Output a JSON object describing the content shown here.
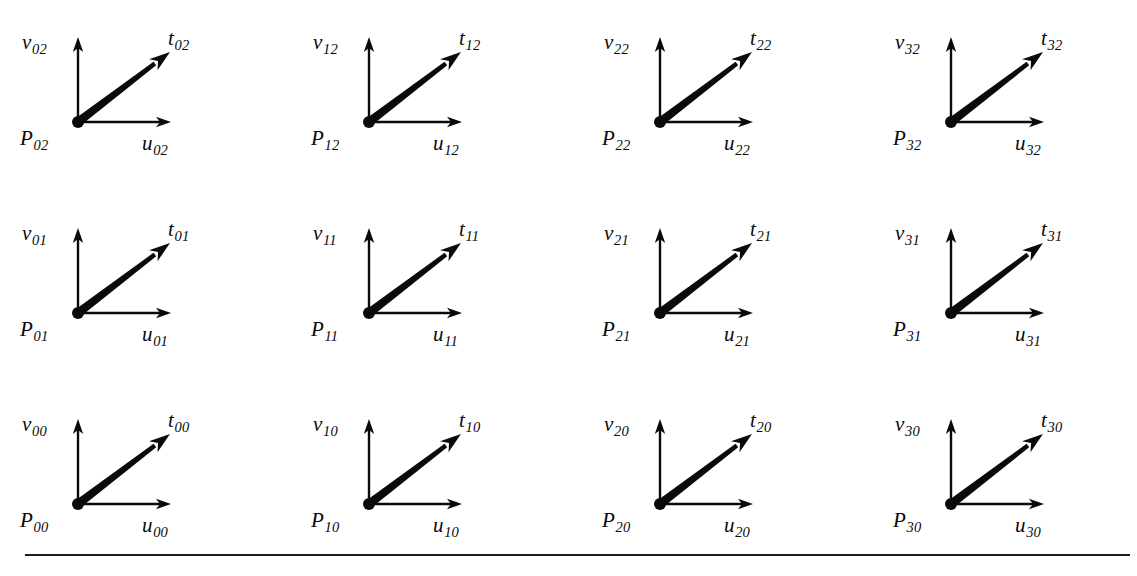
{
  "figure": {
    "background_color": "#ffffff",
    "ink_color": "#0a0a0a",
    "grid": {
      "columns": 4,
      "rows": 3
    },
    "cells": [
      {
        "id": "cell-0-2",
        "column": 0,
        "row": 2,
        "point_label": "P",
        "point_sub": "02",
        "v_label": "v",
        "v_sub": "02",
        "u_label": "u",
        "u_sub": "02",
        "t_label": "t",
        "t_sub": "02"
      },
      {
        "id": "cell-1-2",
        "column": 1,
        "row": 2,
        "point_label": "P",
        "point_sub": "12",
        "v_label": "v",
        "v_sub": "12",
        "u_label": "u",
        "u_sub": "12",
        "t_label": "t",
        "t_sub": "12"
      },
      {
        "id": "cell-2-2",
        "column": 2,
        "row": 2,
        "point_label": "P",
        "point_sub": "22",
        "v_label": "v",
        "v_sub": "22",
        "u_label": "u",
        "u_sub": "22",
        "t_label": "t",
        "t_sub": "22"
      },
      {
        "id": "cell-3-2",
        "column": 3,
        "row": 2,
        "point_label": "P",
        "point_sub": "32",
        "v_label": "v",
        "v_sub": "32",
        "u_label": "u",
        "u_sub": "32",
        "t_label": "t",
        "t_sub": "32"
      },
      {
        "id": "cell-0-1",
        "column": 0,
        "row": 1,
        "point_label": "P",
        "point_sub": "01",
        "v_label": "v",
        "v_sub": "01",
        "u_label": "u",
        "u_sub": "01",
        "t_label": "t",
        "t_sub": "01"
      },
      {
        "id": "cell-1-1",
        "column": 1,
        "row": 1,
        "point_label": "P",
        "point_sub": "11",
        "v_label": "v",
        "v_sub": "11",
        "u_label": "u",
        "u_sub": "11",
        "t_label": "t",
        "t_sub": "11"
      },
      {
        "id": "cell-2-1",
        "column": 2,
        "row": 1,
        "point_label": "P",
        "point_sub": "21",
        "v_label": "v",
        "v_sub": "21",
        "u_label": "u",
        "u_sub": "21",
        "t_label": "t",
        "t_sub": "21"
      },
      {
        "id": "cell-3-1",
        "column": 3,
        "row": 1,
        "point_label": "P",
        "point_sub": "31",
        "v_label": "v",
        "v_sub": "31",
        "u_label": "u",
        "u_sub": "31",
        "t_label": "t",
        "t_sub": "31"
      },
      {
        "id": "cell-0-0",
        "column": 0,
        "row": 0,
        "point_label": "P",
        "point_sub": "00",
        "v_label": "v",
        "v_sub": "00",
        "u_label": "u",
        "u_sub": "00",
        "t_label": "t",
        "t_sub": "00"
      },
      {
        "id": "cell-1-0",
        "column": 1,
        "row": 0,
        "point_label": "P",
        "point_sub": "10",
        "v_label": "v",
        "v_sub": "10",
        "u_label": "u",
        "u_sub": "10",
        "t_label": "t",
        "t_sub": "10"
      },
      {
        "id": "cell-2-0",
        "column": 2,
        "row": 0,
        "point_label": "P",
        "point_sub": "20",
        "v_label": "v",
        "v_sub": "20",
        "u_label": "u",
        "u_sub": "20",
        "t_label": "t",
        "t_sub": "20"
      },
      {
        "id": "cell-3-0",
        "column": 3,
        "row": 0,
        "point_label": "P",
        "point_sub": "30",
        "v_label": "v",
        "v_sub": "30",
        "u_label": "u",
        "u_sub": "30",
        "t_label": "t",
        "t_sub": "30"
      }
    ]
  }
}
